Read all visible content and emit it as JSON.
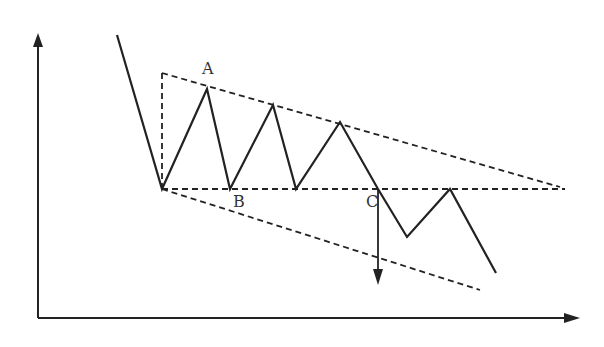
{
  "diagram": {
    "type": "descending-triangle-breakdown",
    "colors": {
      "stroke": "#222222",
      "background": "#ffffff",
      "label": "#333333"
    },
    "axes": {
      "origin": [
        38,
        318
      ],
      "y_axis_top": [
        38,
        33
      ],
      "x_axis_right": [
        580,
        318
      ]
    },
    "price_path": [
      [
        117,
        35
      ],
      [
        162,
        189
      ],
      [
        207,
        89
      ],
      [
        230,
        189
      ],
      [
        273,
        105
      ],
      [
        296,
        189
      ],
      [
        340,
        122
      ],
      [
        378,
        189
      ],
      [
        407,
        237
      ],
      [
        450,
        189
      ],
      [
        496,
        273
      ]
    ],
    "dashed_lines": {
      "vertical_height": [
        [
          162,
          189
        ],
        [
          162,
          73
        ]
      ],
      "upper_trendline": [
        [
          162,
          73
        ],
        [
          560,
          187
        ]
      ],
      "support_line": [
        [
          162,
          189
        ],
        [
          565,
          189
        ]
      ],
      "lower_projection": [
        [
          162,
          189
        ],
        [
          480,
          290
        ]
      ]
    },
    "target_arrow": [
      [
        378,
        189
      ],
      [
        378,
        285
      ]
    ],
    "labels": [
      {
        "id": "A",
        "text": "A",
        "x": 202,
        "y": 74
      },
      {
        "id": "B",
        "text": "B",
        "x": 233,
        "y": 207
      },
      {
        "id": "C",
        "text": "C",
        "x": 366,
        "y": 207
      }
    ]
  }
}
